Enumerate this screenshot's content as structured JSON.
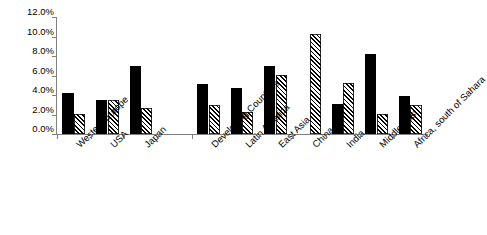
{
  "chart_data": {
    "type": "bar",
    "title": "",
    "subtitle": "",
    "xlabel": "",
    "ylabel": "",
    "ylim": [
      0,
      12
    ],
    "yunit": "%",
    "grid": false,
    "legend": "none",
    "legend_entries": [],
    "categories": [
      "Western Europe",
      "USA",
      "Japan",
      "",
      "Developing Countries",
      "Latin America",
      "East Asia",
      "China",
      "India",
      "Middle East",
      "Africa, south of Sahara"
    ],
    "ytick_labels": [
      "12.0%",
      "10.0%",
      "8.0%",
      "6.0%",
      "4.0%",
      "2.0%",
      "0.0%"
    ],
    "ytick_values": [
      12.0,
      10.0,
      8.0,
      6.0,
      4.0,
      2.0,
      0.0
    ],
    "series": [
      {
        "name": "series-solid",
        "fill": "solid-black",
        "values": [
          4.2,
          3.5,
          7.0,
          null,
          5.1,
          4.7,
          7.0,
          null,
          3.1,
          8.2,
          3.9
        ]
      },
      {
        "name": "series-hatched",
        "fill": "diagonal-hatch",
        "values": [
          2.1,
          3.5,
          2.7,
          null,
          3.0,
          2.3,
          6.1,
          10.3,
          5.2,
          2.1,
          3.0
        ]
      }
    ]
  },
  "axis": {
    "y_label_0": "12.0%",
    "y_label_1": "10.0%",
    "y_label_2": "8.0%",
    "y_label_3": "6.0%",
    "y_label_4": "4.0%",
    "y_label_5": "2.0%",
    "y_label_6": "0.0%"
  },
  "xlabels": {
    "l0": "Western Europe",
    "l1": "USA",
    "l2": "Japan",
    "l4": "Developing Countries",
    "l5": "Latin America",
    "l6": "East Asia",
    "l7": "China",
    "l8": "India",
    "l9": "Middle East",
    "l10": "Africa, south of Sahara"
  },
  "colors": {
    "bar_solid": "#000000",
    "bar_hatch_line": "#000000",
    "bar_hatch_bg": "#ffffff",
    "axis": "#808080",
    "text": "#000000",
    "background": "#ffffff"
  }
}
